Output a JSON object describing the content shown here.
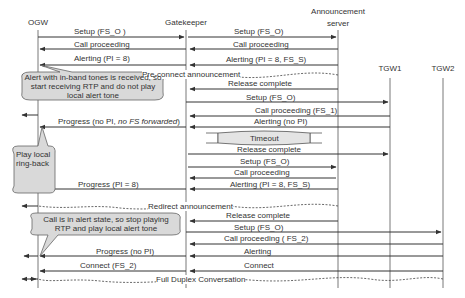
{
  "participants": [
    {
      "id": "ogw",
      "label": "OGW",
      "x": 38
    },
    {
      "id": "gatekeeper",
      "label": "Gatekeeper",
      "x": 186
    },
    {
      "id": "announcement_server",
      "label": "Announcement\nserver",
      "x": 338
    },
    {
      "id": "tgw1",
      "label": "TGW1",
      "x": 390
    },
    {
      "id": "tgw2",
      "label": "TGW2",
      "x": 443
    }
  ],
  "messages": [
    {
      "label": "Setup (FS_O )",
      "from": "ogw",
      "to": "gatekeeper",
      "y": 37
    },
    {
      "label": "Setup (FS_O)",
      "from": "gatekeeper",
      "to": "announcement_server",
      "y": 37
    },
    {
      "label": "Call proceeding",
      "from": "gatekeeper",
      "to": "ogw",
      "y": 49
    },
    {
      "label": "Call proceeding",
      "from": "announcement_server",
      "to": "gatekeeper",
      "y": 49
    },
    {
      "label": "Alerting (PI = 8)",
      "from": "gatekeeper",
      "to": "ogw",
      "y": 65
    },
    {
      "label": "Alerting (PI = 8, FS_S)",
      "from": "announcement_server",
      "to": "gatekeeper",
      "y": 65
    },
    {
      "label": "Pre-connect announcement",
      "type": "media",
      "y": 75
    },
    {
      "label": "Release complete",
      "from": "announcement_server",
      "to": "gatekeeper",
      "y": 89
    },
    {
      "label": "Setup (FS_O)",
      "from": "gatekeeper",
      "to": "tgw1",
      "y": 102
    },
    {
      "label": "Call proceeding (FS_1)",
      "from": "tgw1",
      "to": "gatekeeper",
      "y": 116
    },
    {
      "label": "Progress (no PI, no FS forwarded)",
      "from": "gatekeeper",
      "to": "ogw",
      "y": 127
    },
    {
      "label": "Alerting (no PI)",
      "from": "tgw1",
      "to": "gatekeeper",
      "y": 127
    },
    {
      "label": "Timeout",
      "type": "timer",
      "y": 138
    },
    {
      "label": "Release complete",
      "from": "gatekeeper",
      "to": "tgw1",
      "y": 154
    },
    {
      "label": "Setup (FS_O)",
      "from": "gatekeeper",
      "to": "announcement_server",
      "y": 167
    },
    {
      "label": "Call proceeding",
      "from": "announcement_server",
      "to": "gatekeeper",
      "y": 178
    },
    {
      "label": "Progress (PI = 8)",
      "from": "gatekeeper",
      "to": "ogw",
      "y": 189
    },
    {
      "label": "Alerting (PI = 8, FS_S)",
      "from": "announcement_server",
      "to": "gatekeeper",
      "y": 189
    },
    {
      "label": "Redirect announcement",
      "type": "media",
      "y": 206
    },
    {
      "label": "Release complete",
      "from": "announcement_server",
      "to": "gatekeeper",
      "y": 221
    },
    {
      "label": "Setup (FS_O)",
      "from": "gatekeeper",
      "to": "tgw2",
      "y": 232
    },
    {
      "label": "Call proceeding ( FS_2)",
      "from": "tgw2",
      "to": "gatekeeper",
      "y": 244
    },
    {
      "label": "Progress (no PI)",
      "from": "gatekeeper",
      "to": "ogw",
      "y": 256
    },
    {
      "label": "Alerting",
      "from": "tgw2",
      "to": "gatekeeper",
      "y": 256
    },
    {
      "label": "Connect (FS_2)",
      "from": "gatekeeper",
      "to": "ogw",
      "y": 271
    },
    {
      "label": "Connect",
      "from": "tgw2",
      "to": "gatekeeper",
      "y": 271
    },
    {
      "label": "Full Duplex Conversation",
      "type": "media",
      "y": 279
    }
  ],
  "header": {
    "ogw": "OGW",
    "gatekeeper": "Gatekeeper",
    "announcement_server_line1": "Announcement",
    "announcement_server_line2": "server",
    "tgw1": "TGW1",
    "tgw2": "TGW2"
  },
  "labels": {
    "m1": "Setup (FS_O )",
    "m2": "Setup (FS_O)",
    "m3": "Call proceeding",
    "m4": "Call proceeding",
    "m5": "Alerting (PI = 8)",
    "m6": "Alerting (PI = 8, FS_S)",
    "m7": "Pre-connect announcement",
    "m8": "Release complete",
    "m9": "Setup (FS_O)",
    "m10": "Call proceeding (FS_1)",
    "m11a": "Progress (no PI, ",
    "m11b": "no FS forwarded",
    "m11c": ")",
    "m12": "Alerting (no PI)",
    "m13": "Timeout",
    "m14": "Release complete",
    "m15": "Setup (FS_O)",
    "m16": "Call proceeding",
    "m17": "Progress (PI = 8)",
    "m18": "Alerting (PI = 8, FS_S)",
    "m19": "Redirect announcement",
    "m20": "Release complete",
    "m21": "Setup (FS_O)",
    "m22": "Call proceeding ( FS_2)",
    "m23": "Progress (no PI)",
    "m24": "Alerting",
    "m25": "Connect (FS_2)",
    "m26": "Connect",
    "m27": "Full Duplex Conversation"
  },
  "callouts": {
    "c1": "Alert with in-band tones is received, so start receiving RTP and do not play local alert tone",
    "c2": "Play local ring-back",
    "c3": "Call is in alert state, so stop playing RTP and play local alert tone"
  },
  "colors": {
    "line": "#333333",
    "callout_fill": "#d9d9d9",
    "timer_fill": "#e4e4e4"
  }
}
